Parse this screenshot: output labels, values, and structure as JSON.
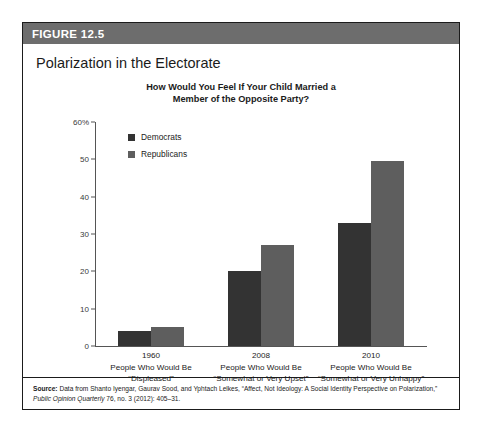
{
  "figure": {
    "header_label": "FIGURE 12.5",
    "title": "Polarization in the Electorate"
  },
  "source": {
    "label": "Source:",
    "text": " Data from Shanto Iyengar, Gaurav Sood, and Yphtach Lelkes, “Affect, Not Ideology: A Social Identity Perspective on Polarization,” ",
    "journal": "Public Opinion Quarterly",
    "text_end": " 76, no. 3 (2012): 405–31."
  },
  "colors": {
    "democrats": "#333333",
    "republicans": "#5e5e5e",
    "header_bg": "#6d6d6d",
    "axis": "#555555"
  },
  "chart_data": {
    "type": "bar",
    "title": "How Would You Feel If Your Child Married a Member of the Opposite Party?",
    "title_line1": "How Would You Feel If Your Child Married a",
    "title_line2": "Member of the Opposite Party?",
    "xlabel": "",
    "ylabel": "",
    "ylim": [
      0,
      60
    ],
    "yticks": [
      0,
      10,
      20,
      30,
      40,
      50,
      60
    ],
    "ytick_labels": [
      "0",
      "10",
      "20",
      "30",
      "40",
      "50",
      "60%"
    ],
    "grid": false,
    "legend_position": "top-left-inside",
    "categories": [
      "1960",
      "2008",
      "2010"
    ],
    "category_sublabels": [
      [
        "People Who Would Be",
        "“Displeased”"
      ],
      [
        "People Who Would Be",
        "“Somewhat or Very Upset”"
      ],
      [
        "People Who Would Be",
        "“Somewhat or Very Unhappy”"
      ]
    ],
    "series": [
      {
        "name": "Democrats",
        "values": [
          4,
          20,
          33
        ]
      },
      {
        "name": "Republicans",
        "values": [
          5,
          27,
          49.5
        ]
      }
    ]
  }
}
